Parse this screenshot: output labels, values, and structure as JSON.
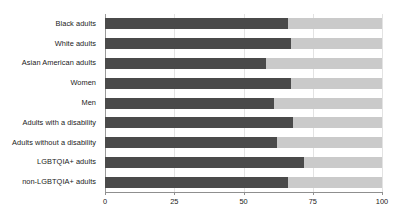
{
  "chart_data": {
    "type": "bar",
    "orientation": "horizontal",
    "stacked": true,
    "title": "",
    "subtitle": "",
    "xlabel": "",
    "ylabel": "",
    "xlim": [
      0,
      100
    ],
    "xticks": [
      0,
      25,
      50,
      75,
      100
    ],
    "xtick_labels": [
      "0",
      "25",
      "50",
      "75",
      "100"
    ],
    "grid": true,
    "legend": "none",
    "categories": [
      "Black adults",
      "White adults",
      "Asian American adults",
      "Women",
      "Men",
      "Adults with a disability",
      "Adults without a disability",
      "LGBTQIA+ adults",
      "non-LGBTQIA+ adults"
    ],
    "series": [
      {
        "name": "primary",
        "color": "#4a4a4a",
        "values": [
          66,
          67,
          58,
          67,
          61,
          68,
          62,
          72,
          66
        ]
      },
      {
        "name": "remainder",
        "color": "#cacaca",
        "values": [
          34,
          33,
          42,
          33,
          39,
          32,
          38,
          28,
          34
        ]
      }
    ]
  },
  "colors": {
    "primary": "#4a4a4a",
    "remainder": "#cacaca",
    "gridline": "#e3e3e3",
    "axis": "#8f8f8f",
    "text": "#1a1a1a",
    "background": "#ffffff"
  }
}
